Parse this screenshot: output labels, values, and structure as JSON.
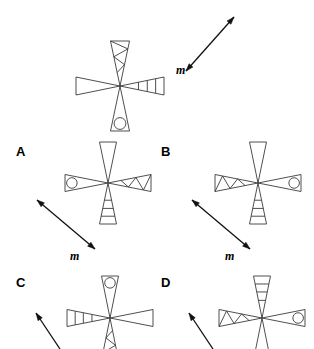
{
  "figure": {
    "title": "",
    "arm_patterns": {
      "plain": "plain-tapered-cone",
      "zigzag": "zigzag-filled-cone",
      "barred": "barred-cone",
      "circle": "cone-with-circle"
    }
  },
  "stimulus": {
    "name": "reference-pinwheel",
    "center": {
      "x": 120,
      "y": 86
    },
    "arms": {
      "up": "zigzag",
      "right": "barred",
      "down": "circle",
      "left": "plain"
    },
    "mirror_line": {
      "label": "m",
      "x1": 234,
      "y1": 17,
      "x2": 186,
      "y2": 71,
      "label_x": 176,
      "label_y": 63,
      "double_headed": true
    }
  },
  "options": [
    {
      "id": "A",
      "label": "A",
      "label_x": 16,
      "label_y": 144,
      "center": {
        "x": 108,
        "y": 183
      },
      "arms": {
        "up": "plain",
        "right": "zigzag",
        "down": "barred",
        "left": "circle"
      },
      "mirror_line": {
        "label": "m",
        "x1": 95,
        "y1": 249,
        "x2": 37,
        "y2": 200,
        "label_x": 70,
        "label_y": 249,
        "double_headed": true
      }
    },
    {
      "id": "B",
      "label": "B",
      "label_x": 161,
      "label_y": 144,
      "center": {
        "x": 258,
        "y": 183
      },
      "arms": {
        "up": "plain",
        "right": "circle",
        "down": "barred",
        "left": "zigzag"
      },
      "mirror_line": {
        "label": "m",
        "x1": 250,
        "y1": 249,
        "x2": 192,
        "y2": 200,
        "label_x": 225,
        "label_y": 249,
        "double_headed": true
      }
    },
    {
      "id": "C",
      "label": "C",
      "label_x": 16,
      "label_y": 275,
      "center": {
        "x": 110,
        "y": 318
      },
      "arms": {
        "up": "circle",
        "right": "plain",
        "down": "zigzag",
        "left": "barred"
      },
      "mirror_line": {
        "label": "",
        "x1": 60,
        "y1": 349,
        "x2": 36,
        "y2": 313,
        "label_x": 0,
        "label_y": 0,
        "double_headed": false
      }
    },
    {
      "id": "D",
      "label": "D",
      "label_x": 161,
      "label_y": 275,
      "center": {
        "x": 262,
        "y": 318
      },
      "arms": {
        "up": "barred",
        "right": "circle",
        "down": "plain",
        "left": "zigzag"
      },
      "mirror_line": {
        "label": "",
        "x1": 213,
        "y1": 349,
        "x2": 189,
        "y2": 313,
        "label_x": 0,
        "label_y": 0,
        "double_headed": false
      }
    }
  ],
  "colors": {
    "stroke": "#3b3b3b",
    "text": "#000000",
    "background": "#ffffff"
  }
}
